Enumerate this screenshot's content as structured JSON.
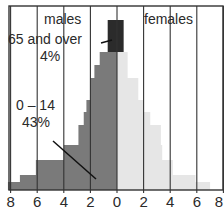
{
  "chart_data": {
    "type": "bar",
    "subtype": "population-pyramid",
    "title": "",
    "xlabel": "",
    "ylabel": "",
    "x_tick_labels": [
      "8",
      "6",
      "4",
      "2",
      "0",
      "2",
      "4",
      "6",
      "8"
    ],
    "xlim": [
      -8,
      8
    ],
    "grid": true,
    "legend": [
      "males",
      "females"
    ],
    "annotations": [
      {
        "text": "65 and over",
        "value": "4%"
      },
      {
        "text": "0 – 14",
        "value": "43%"
      }
    ],
    "age_bands_bottom_to_top": [
      "0-4",
      "5-9",
      "10-14",
      "15-19",
      "20-24",
      "25-34",
      "35-44",
      "45-54",
      "55-64",
      "65+ (a)",
      "65+ (b)"
    ],
    "series": [
      {
        "name": "males",
        "color": "#7a7a7a",
        "values": [
          8.2,
          7.3,
          6.1,
          4.0,
          2.9,
          2.5,
          2.3,
          2.0,
          1.7,
          1.3,
          0.7
        ]
      },
      {
        "name": "females",
        "color": "#e6e6e6",
        "values": [
          7.0,
          5.9,
          4.2,
          3.4,
          3.3,
          2.5,
          2.0,
          1.6,
          0.8,
          0.8,
          0.5
        ]
      }
    ],
    "highlight": {
      "band": "65+",
      "color": "#2b2b2b"
    }
  },
  "labels": {
    "males": "males",
    "females": "females",
    "old_age": "65 and over",
    "old_pct": "4%",
    "young_age": "0 – 14",
    "young_pct": "43%"
  },
  "ticks": [
    "8",
    "6",
    "4",
    "2",
    "0",
    "2",
    "4",
    "6",
    "8"
  ]
}
